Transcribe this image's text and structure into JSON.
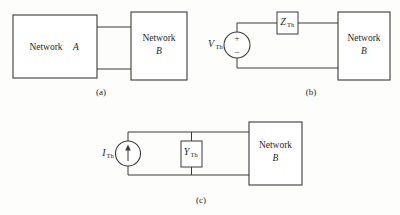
{
  "figure": {
    "background_color": "#fdfdfc",
    "line_color": "#3a3a3a",
    "text_color": "#1f1f1f"
  },
  "panels": [
    {
      "id": "a",
      "caption": "(a)",
      "blocks": [
        {
          "name": "network-a",
          "label": "Network",
          "italic_label": "A",
          "inline": true
        },
        {
          "name": "network-b",
          "label": "Network",
          "italic_label": "B",
          "inline": false
        }
      ],
      "components": []
    },
    {
      "id": "b",
      "caption": "(b)",
      "blocks": [
        {
          "name": "network-b",
          "label": "Network",
          "italic_label": "B",
          "inline": false
        }
      ],
      "components": [
        {
          "name": "voltage-source-vth",
          "type": "voltage-source",
          "symbol": "V",
          "subscript": "Th",
          "polarity_plus": "+",
          "polarity_minus": "–"
        },
        {
          "name": "impedance-zth",
          "type": "impedance",
          "symbol": "Z",
          "subscript": "Th"
        }
      ]
    },
    {
      "id": "c",
      "caption": "(c)",
      "blocks": [
        {
          "name": "network-b",
          "label": "Network",
          "italic_label": "B",
          "inline": false
        }
      ],
      "components": [
        {
          "name": "current-source-ith",
          "type": "current-source",
          "symbol": "I",
          "subscript": "Th",
          "arrow_direction": "up"
        },
        {
          "name": "admittance-yth",
          "type": "admittance",
          "symbol": "Y",
          "subscript": "Th"
        }
      ]
    }
  ],
  "labels": {
    "network_word": "Network",
    "network_a_letter": "A",
    "network_b_letter": "B",
    "v_symbol": "V",
    "i_symbol": "I",
    "z_symbol": "Z",
    "y_symbol": "Y",
    "th_subscript": "Th",
    "plus_sign": "+",
    "minus_sign": "–",
    "caption_a": "(a)",
    "caption_b": "(b)",
    "caption_c": "(c)"
  }
}
